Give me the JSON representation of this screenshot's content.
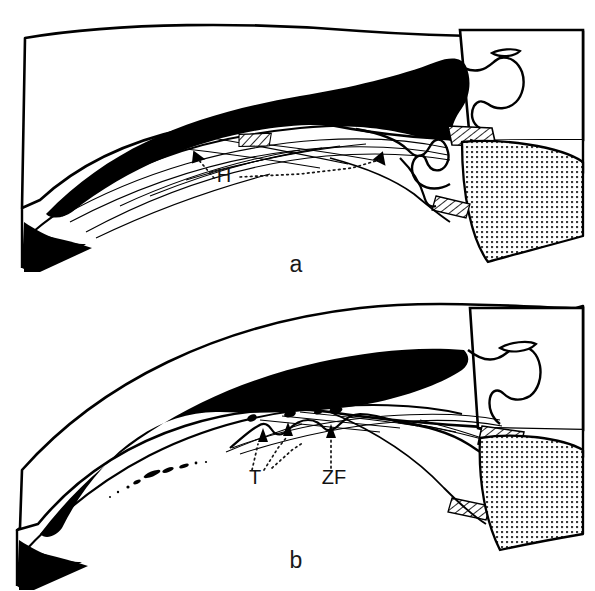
{
  "figure": {
    "type": "anatomical-line-drawing",
    "background_color": "#ffffff",
    "ink_color": "#000000",
    "width": 595,
    "height": 591
  },
  "panels": [
    {
      "id": "a",
      "caption": "a",
      "caption_x": 296,
      "caption_y": 272,
      "labels": [
        {
          "id": "H",
          "text": "H",
          "x": 224,
          "y": 182,
          "leader_arrow_targets": [
            {
              "x": 196,
              "y": 155
            },
            {
              "x": 381,
              "y": 157
            }
          ]
        }
      ],
      "regions": [
        {
          "name": "cornea",
          "fill": "none",
          "stroke": "#000000"
        },
        {
          "name": "anterior-chamber",
          "fill": "#000000"
        },
        {
          "name": "iris",
          "fill": "none",
          "stroke": "#000000"
        },
        {
          "name": "trabecular-meshwork",
          "fill": "hatched"
        },
        {
          "name": "schlemms-canal",
          "fill": "none"
        },
        {
          "name": "ciliary-body",
          "fill": "stipple"
        },
        {
          "name": "sclera",
          "fill": "none"
        }
      ]
    },
    {
      "id": "b",
      "caption": "b",
      "caption_x": 296,
      "caption_y": 568,
      "labels": [
        {
          "id": "T",
          "text": "T",
          "x": 255,
          "y": 484,
          "leader_arrow_targets": [
            {
              "x": 263,
              "y": 436
            },
            {
              "x": 288,
              "y": 430
            }
          ]
        },
        {
          "id": "ZF",
          "text": "ZF",
          "x": 316,
          "y": 484,
          "leader_arrow_targets": [
            {
              "x": 331,
              "y": 432
            }
          ]
        }
      ],
      "regions": [
        {
          "name": "cornea",
          "fill": "none",
          "stroke": "#000000"
        },
        {
          "name": "anterior-chamber",
          "fill": "#000000"
        },
        {
          "name": "iris",
          "fill": "none",
          "stroke": "#000000"
        },
        {
          "name": "zonular-fibers",
          "fill": "none"
        },
        {
          "name": "ciliary-body",
          "fill": "stipple"
        },
        {
          "name": "sclera",
          "fill": "none"
        }
      ]
    }
  ],
  "style": {
    "stipple_dot_color": "#333333",
    "stipple_pitch_px": 5,
    "leader_line_style": "dotted",
    "panel_letter_font_size": 23,
    "struct_label_font_size": 20
  }
}
